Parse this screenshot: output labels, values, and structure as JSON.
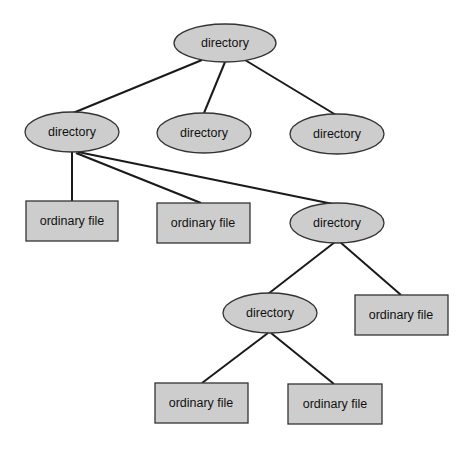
{
  "diagram": {
    "title": "",
    "colors": {
      "node_fill": "#cdcdcd",
      "stroke": "#333333",
      "edge": "#1a1a1a",
      "background": "#ffffff"
    },
    "nodes": [
      {
        "id": "root",
        "type": "directory",
        "label": "directory"
      },
      {
        "id": "d1",
        "type": "directory",
        "label": "directory"
      },
      {
        "id": "d2",
        "type": "directory",
        "label": "directory"
      },
      {
        "id": "d3",
        "type": "directory",
        "label": "directory"
      },
      {
        "id": "f1",
        "type": "ordinary-file",
        "label": "ordinary file"
      },
      {
        "id": "f2",
        "type": "ordinary-file",
        "label": "ordinary file"
      },
      {
        "id": "d4",
        "type": "directory",
        "label": "directory"
      },
      {
        "id": "d5",
        "type": "directory",
        "label": "directory"
      },
      {
        "id": "f3",
        "type": "ordinary-file",
        "label": "ordinary file"
      },
      {
        "id": "f4",
        "type": "ordinary-file",
        "label": "ordinary file"
      },
      {
        "id": "f5",
        "type": "ordinary-file",
        "label": "ordinary file"
      }
    ],
    "edges": [
      [
        "root",
        "d1"
      ],
      [
        "root",
        "d2"
      ],
      [
        "root",
        "d3"
      ],
      [
        "d1",
        "f1"
      ],
      [
        "d1",
        "f2"
      ],
      [
        "d1",
        "d4"
      ],
      [
        "d4",
        "d5"
      ],
      [
        "d4",
        "f3"
      ],
      [
        "d5",
        "f4"
      ],
      [
        "d5",
        "f5"
      ]
    ]
  }
}
